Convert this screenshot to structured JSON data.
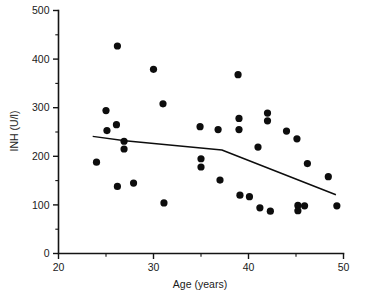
{
  "chart_data": {
    "type": "scatter",
    "title": "",
    "xlabel": "Age (years)",
    "ylabel": "INH (U/l)",
    "xlim": [
      20,
      50
    ],
    "ylim": [
      0,
      500
    ],
    "grid": false,
    "legend": "none",
    "x_major_ticks": [
      20,
      30,
      40,
      50
    ],
    "x_minor_ticks": [
      25,
      35,
      45
    ],
    "y_major_ticks": [
      0,
      100,
      200,
      300,
      400,
      500
    ],
    "y_minor_ticks": [
      50,
      150,
      250,
      350,
      450
    ],
    "x_tick_labels": [
      "20",
      "30",
      "40",
      "50"
    ],
    "y_tick_labels": [
      "0",
      "100",
      "200",
      "300",
      "400",
      "500"
    ],
    "marker": "filled-circle",
    "marker_color": "#0d0d0d",
    "points": [
      {
        "x": 24.0,
        "y": 188
      },
      {
        "x": 25.0,
        "y": 294
      },
      {
        "x": 25.1,
        "y": 253
      },
      {
        "x": 26.2,
        "y": 427
      },
      {
        "x": 26.1,
        "y": 265
      },
      {
        "x": 26.2,
        "y": 138
      },
      {
        "x": 26.9,
        "y": 231
      },
      {
        "x": 26.9,
        "y": 215
      },
      {
        "x": 27.9,
        "y": 145
      },
      {
        "x": 30.0,
        "y": 379
      },
      {
        "x": 31.0,
        "y": 308
      },
      {
        "x": 31.1,
        "y": 104
      },
      {
        "x": 34.9,
        "y": 261
      },
      {
        "x": 35.0,
        "y": 195
      },
      {
        "x": 35.0,
        "y": 178
      },
      {
        "x": 36.8,
        "y": 255
      },
      {
        "x": 37.0,
        "y": 151
      },
      {
        "x": 38.9,
        "y": 368
      },
      {
        "x": 39.0,
        "y": 278
      },
      {
        "x": 39.0,
        "y": 255
      },
      {
        "x": 39.1,
        "y": 120
      },
      {
        "x": 40.1,
        "y": 117
      },
      {
        "x": 41.0,
        "y": 219
      },
      {
        "x": 41.2,
        "y": 94
      },
      {
        "x": 42.0,
        "y": 289
      },
      {
        "x": 42.0,
        "y": 273
      },
      {
        "x": 42.3,
        "y": 87
      },
      {
        "x": 44.0,
        "y": 252
      },
      {
        "x": 45.1,
        "y": 236
      },
      {
        "x": 45.2,
        "y": 99
      },
      {
        "x": 45.2,
        "y": 88
      },
      {
        "x": 45.9,
        "y": 98
      },
      {
        "x": 46.2,
        "y": 185
      },
      {
        "x": 48.4,
        "y": 158
      },
      {
        "x": 49.3,
        "y": 98
      }
    ],
    "trend_line": {
      "name": "smoothed regression",
      "color": "#0d0d0d",
      "x": [
        23.6,
        27.0,
        37.2,
        49.2
      ],
      "y": [
        241,
        232,
        213,
        121
      ]
    }
  }
}
